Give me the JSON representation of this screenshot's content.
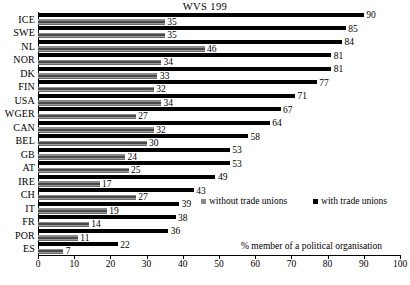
{
  "chart_data": {
    "type": "bar",
    "orientation": "horizontal",
    "title": "WVS 199",
    "xlabel": "% member of a political organisation",
    "ylabel": "",
    "xlim": [
      0,
      100
    ],
    "xticks": [
      0,
      10,
      20,
      30,
      40,
      50,
      60,
      70,
      80,
      90,
      100
    ],
    "grid": false,
    "legend_position": "inside-bottom-right",
    "categories": [
      "ICE",
      "SWE",
      "NL",
      "NOR",
      "DK",
      "FIN",
      "USA",
      "WGER",
      "CAN",
      "BEL",
      "GB",
      "AT",
      "IRE",
      "CH",
      "IT",
      "FR",
      "POR",
      "ES"
    ],
    "series": [
      {
        "name": "with trade unions",
        "color": "#000000",
        "values": [
          90,
          85,
          84,
          81,
          81,
          77,
          71,
          67,
          64,
          58,
          53,
          53,
          49,
          43,
          39,
          38,
          36,
          22
        ]
      },
      {
        "name": "without trade unions",
        "color": "#8a8a8a",
        "values": [
          35,
          35,
          46,
          34,
          33,
          32,
          34,
          27,
          32,
          30,
          24,
          25,
          17,
          27,
          19,
          14,
          11,
          7
        ]
      }
    ]
  },
  "legend": {
    "without_label": "without trade unions",
    "with_label": "with trade unions"
  }
}
